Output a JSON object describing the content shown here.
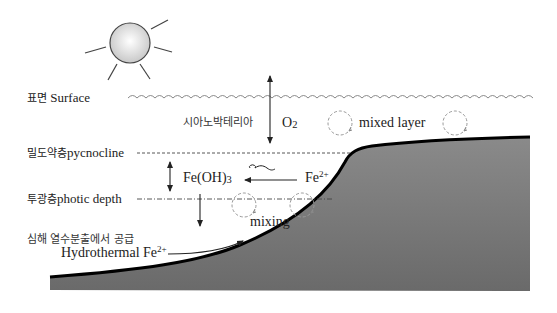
{
  "diagram": {
    "colors": {
      "seafloor_fill": "#7a7a7a",
      "seafloor_edge": "#000000",
      "line": "#333333",
      "dashed_circle": "#999999",
      "sun_fill": "#d9d9d9",
      "text": "#222222"
    },
    "icons": {
      "sun": "sun-icon",
      "waves": "wave-surface-icon",
      "mixing_circle": "circular-arrow-icon",
      "cyanobacterium": "squiggle-icon"
    },
    "labels": {
      "surface_kr": "표면",
      "surface_en": "Surface",
      "cyanobacteria_kr": "시아노박테리아",
      "o2_main": "O",
      "o2_sub": "2",
      "mixed_layer": "mixed layer",
      "pycnocline_kr": "밀도약층",
      "pycnocline_en": "pycnocline",
      "feoh3_main": "Fe(OH)",
      "feoh3_sub": "3",
      "fe2_main": "Fe",
      "fe2_sup": "2+",
      "photic_kr": "투광층",
      "photic_en": "photic depth",
      "mixing": "mixing",
      "hydro_kr": "심해 열수분출에서 공급",
      "hydro_en_main": "Hydrothermal Fe",
      "hydro_en_sup": "2+"
    }
  }
}
